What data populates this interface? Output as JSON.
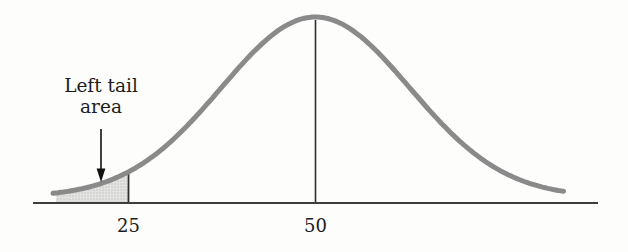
{
  "chart_data": {
    "type": "area",
    "title": "",
    "curve": {
      "distribution": "normal",
      "mean": 50,
      "sigma": 12.6,
      "x_start": 14.9,
      "x_end": 83.4
    },
    "axis": {
      "x_min": 12.3,
      "x_max": 87.9,
      "grid": false,
      "y_axis_shown": false
    },
    "x_ticks": [
      {
        "value": 25,
        "label": "25"
      },
      {
        "value": 50,
        "label": "50"
      }
    ],
    "mean_line_at": 50,
    "shaded_region": {
      "x_from": 15.3,
      "x_to": 25,
      "meaning": "left tail area under the curve"
    },
    "annotation": {
      "line1": "Left tail",
      "line2": "area",
      "points_to": "shaded left tail region"
    },
    "colors": {
      "curve": "#8a8a8a",
      "axis": "#3d3d3d",
      "reference_line": "#2e2e2e",
      "shade_fill": "#e3e3e1",
      "shade_dot": "#bcbcba",
      "arrow": "#111111",
      "text": "#1c1c1c",
      "background": "#fdfdfc"
    }
  }
}
